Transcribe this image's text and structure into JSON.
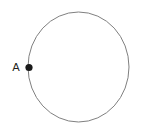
{
  "figure": {
    "type": "geometry-diagram",
    "background_color": "#ffffff",
    "canvas": {
      "width": 146,
      "height": 129
    },
    "circle": {
      "name": "circle",
      "center_x": 78.5,
      "center_y": 67,
      "radius_x": 50.5,
      "radius_y": 55,
      "stroke_color": "#808080",
      "stroke_width": 1,
      "fill": "none"
    },
    "points": [
      {
        "label": "A",
        "marker_x": 29,
        "marker_y": 67.5,
        "marker_radius": 3.6,
        "marker_color": "#1a1a1a",
        "label_x": 16,
        "label_y": 71,
        "label_color": "#231f20"
      }
    ]
  }
}
